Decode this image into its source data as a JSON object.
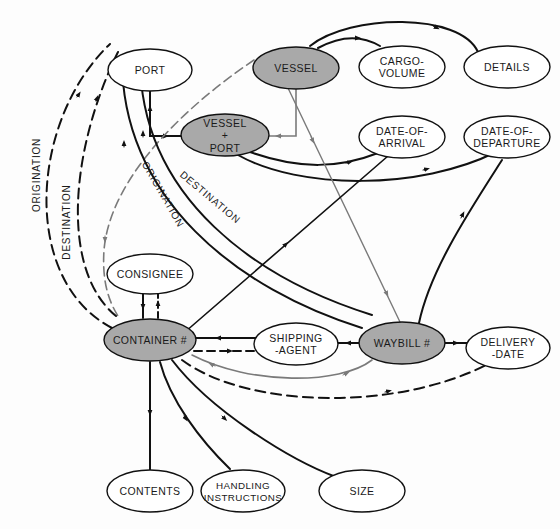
{
  "colors": {
    "background": "#fdfdfd",
    "line_black": "#111111",
    "line_gray": "#7a7a7a",
    "node_shaded": "#a9a9a9",
    "node_plain": "#ffffff"
  },
  "nodes": {
    "port": {
      "label": [
        "PORT"
      ],
      "shaded": false
    },
    "vessel": {
      "label": [
        "VESSEL"
      ],
      "shaded": true
    },
    "cargo_volume": {
      "label": [
        "CARGO-",
        "VOLUME"
      ],
      "shaded": false
    },
    "details": {
      "label": [
        "DETAILS"
      ],
      "shaded": false
    },
    "vessel_port": {
      "label": [
        "VESSEL",
        "+",
        "PORT"
      ],
      "shaded": true
    },
    "date_of_arrival": {
      "label": [
        "DATE-OF-",
        "ARRIVAL"
      ],
      "shaded": false
    },
    "date_of_departure": {
      "label": [
        "DATE-OF-",
        "DEPARTURE"
      ],
      "shaded": false
    },
    "consignee": {
      "label": [
        "CONSIGNEE"
      ],
      "shaded": false
    },
    "container": {
      "label": [
        "CONTAINER #"
      ],
      "shaded": true
    },
    "shipping_agent": {
      "label": [
        "SHIPPING",
        "-AGENT"
      ],
      "shaded": false
    },
    "waybill": {
      "label": [
        "WAYBILL #"
      ],
      "shaded": true
    },
    "delivery_date": {
      "label": [
        "DELIVERY",
        "-DATE"
      ],
      "shaded": false
    },
    "contents": {
      "label": [
        "CONTENTS"
      ],
      "shaded": false
    },
    "handling_instructions": {
      "label": [
        "HANDLING",
        "INSTRUCTIONS"
      ],
      "shaded": false
    },
    "size": {
      "label": [
        "SIZE"
      ],
      "shaded": false
    }
  },
  "edge_labels": {
    "origination_outer": "ORIGINATION",
    "destination_outer": "DESTINATION",
    "origination_inner": "ORIGINATION",
    "destination_inner": "DESTINATION"
  },
  "edges": [
    {
      "from": "vessel",
      "to": "cargo_volume",
      "style": "solid"
    },
    {
      "from": "vessel",
      "to": "details",
      "style": "solid"
    },
    {
      "from": "vessel",
      "to": "vessel_port",
      "style": "gray"
    },
    {
      "from": "port",
      "to": "vessel_port",
      "style": "solid"
    },
    {
      "from": "vessel_port",
      "to": "date_of_arrival",
      "style": "solid"
    },
    {
      "from": "vessel_port",
      "to": "date_of_departure",
      "style": "solid"
    },
    {
      "from": "vessel",
      "to": "waybill",
      "style": "gray"
    },
    {
      "from": "vessel",
      "to": "container",
      "style": "gray-dashed"
    },
    {
      "from": "container",
      "to": "port",
      "style": "dashed",
      "label": "ORIGINATION"
    },
    {
      "from": "container",
      "to": "port",
      "style": "dashed",
      "label": "DESTINATION"
    },
    {
      "from": "waybill",
      "to": "port",
      "style": "solid",
      "label": "ORIGINATION"
    },
    {
      "from": "waybill",
      "to": "port",
      "style": "solid",
      "label": "DESTINATION"
    },
    {
      "from": "container",
      "to": "date_of_arrival",
      "style": "solid"
    },
    {
      "from": "waybill",
      "to": "date_of_departure",
      "style": "solid"
    },
    {
      "from": "container",
      "to": "consignee",
      "style": "solid"
    },
    {
      "from": "consignee",
      "to": "container",
      "style": "dashed"
    },
    {
      "from": "shipping_agent",
      "to": "container",
      "style": "solid"
    },
    {
      "from": "container",
      "to": "shipping_agent",
      "style": "dashed"
    },
    {
      "from": "waybill",
      "to": "shipping_agent",
      "style": "solid"
    },
    {
      "from": "waybill",
      "to": "delivery_date",
      "style": "solid"
    },
    {
      "from": "container",
      "to": "waybill",
      "style": "gray"
    },
    {
      "from": "container",
      "to": "delivery_date",
      "style": "dashed"
    },
    {
      "from": "container",
      "to": "contents",
      "style": "solid"
    },
    {
      "from": "container",
      "to": "handling_instructions",
      "style": "solid"
    },
    {
      "from": "container",
      "to": "size",
      "style": "solid"
    }
  ]
}
